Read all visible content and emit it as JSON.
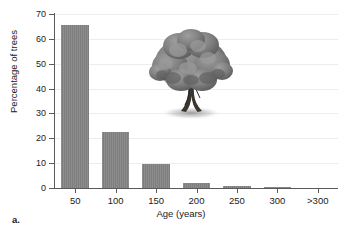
{
  "figure": {
    "caption": "a.",
    "illustration": "oak-tree"
  },
  "chart_data": {
    "type": "bar",
    "title": "",
    "xlabel": "Age (years)",
    "ylabel": "Percentage of trees",
    "categories": [
      "50",
      "100",
      "150",
      "200",
      "250",
      "300",
      ">300"
    ],
    "values": [
      65.5,
      22.5,
      9.5,
      2.0,
      1.0,
      0.5,
      0
    ],
    "ylim": [
      0,
      70
    ],
    "yticks": [
      0,
      10,
      20,
      30,
      40,
      50,
      60,
      70
    ],
    "ytick_labels": [
      "0",
      "10",
      "20",
      "30",
      "40",
      "50",
      "60",
      "70"
    ],
    "grid": true,
    "legend": "none",
    "bar_color": "#7d7d7d",
    "axis_color": "#5a5a5a",
    "grid_color": "#ededed"
  }
}
